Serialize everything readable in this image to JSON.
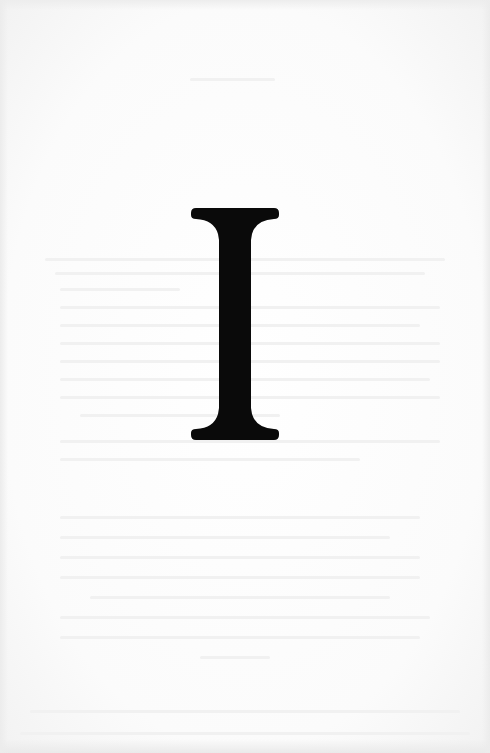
{
  "page": {
    "type": "scanned book page",
    "numeral": "I",
    "numeral_color": "#0a0a0a",
    "paper_color": "#fdfdfd"
  }
}
